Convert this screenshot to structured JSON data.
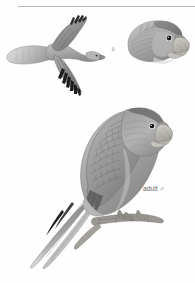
{
  "plate": {
    "title": "Parrot identification plate",
    "background_color": "#fefefe",
    "divider_color": "#b9b9b9",
    "width": 195,
    "height": 283
  },
  "labels": {
    "adult_male": "adult ♂",
    "female_symbol": "♀"
  },
  "figures": [
    {
      "id": "flight",
      "name": "bird-in-flight",
      "caption": "",
      "description": "parrot in flight, upper surface, dark pointed wingtips"
    },
    {
      "id": "head",
      "name": "female-head-portrait",
      "caption": "♀",
      "description": "female head profile with pale hooked bill"
    },
    {
      "id": "perched",
      "name": "adult-male-perched",
      "caption": "adult ♂",
      "description": "adult male perched on branch, long pointed tail"
    }
  ],
  "palette": {
    "plumage_light": "#cfcfcf",
    "plumage_mid": "#9d9d9d",
    "plumage_dark": "#6e6e6e",
    "plumage_darkest": "#3a3a3a",
    "feather_black": "#1d1d1d",
    "bill_pale": "#c8c6c2",
    "bill_shadow": "#9b9792",
    "branch": "#8d8a85",
    "eye": "#151515",
    "outline": "#5a5a5a"
  }
}
